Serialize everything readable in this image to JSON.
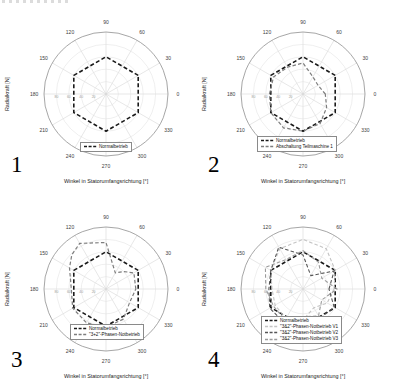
{
  "colors": {
    "black_series": "#1a1a1a",
    "gray_series": "#7d7d7d",
    "light_gray_series": "#c4c4c4",
    "dark_gray_series": "#565656",
    "mid_gray_series": "#9b9b9b",
    "grid_ring": "#dedede",
    "grid_spoke": "#d6d6d6",
    "outer_ring": "#8f8f8f",
    "tick_text": "#3c3c3c",
    "radial_tick_text": "#9a9a9a"
  },
  "panels": [
    {
      "number": "1",
      "xlabel": "Winkel in Statorumfangsrichtung [°]",
      "ylabel": "Radialkraft [N]",
      "angle_labels": [
        "0",
        "30",
        "60",
        "90",
        "120",
        "150",
        "180",
        "210",
        "240",
        "270",
        "300",
        "330"
      ],
      "radial_labels": [
        "20",
        "40",
        "60",
        "80"
      ],
      "legend_pos": {
        "left": 80,
        "top": 142
      },
      "legend": [
        {
          "label": "Normalbetrieb",
          "color": "#1a1a1a"
        }
      ],
      "series": [
        {
          "name": "Normalbetrieb",
          "color": "#1a1a1a",
          "width": 1.6,
          "dash": "4,2.4",
          "points": [
            [
              30,
              0.6
            ],
            [
              90,
              0.6
            ],
            [
              150,
              0.6
            ],
            [
              210,
              0.6
            ],
            [
              270,
              0.6
            ],
            [
              330,
              0.6
            ]
          ]
        }
      ]
    },
    {
      "number": "2",
      "xlabel": "Winkel in Statorumfangsrichtung [°]",
      "ylabel": "Radialkraft [N]",
      "angle_labels": [
        "0",
        "30",
        "60",
        "90",
        "120",
        "150",
        "180",
        "210",
        "240",
        "270",
        "300",
        "330"
      ],
      "radial_labels": [
        "20",
        "40",
        "60",
        "80"
      ],
      "legend_pos": {
        "left": 60,
        "top": 136
      },
      "legend": [
        {
          "label": "Normalbetrieb",
          "color": "#1a1a1a"
        },
        {
          "label": "Abschaltung Teilmaschine 1",
          "color": "#7d7d7d"
        }
      ],
      "series": [
        {
          "name": "Normalbetrieb",
          "color": "#1a1a1a",
          "width": 1.6,
          "dash": "4,2.4",
          "points": [
            [
              30,
              0.6
            ],
            [
              90,
              0.6
            ],
            [
              150,
              0.6
            ],
            [
              210,
              0.6
            ],
            [
              270,
              0.6
            ],
            [
              330,
              0.6
            ]
          ]
        },
        {
          "name": "Abschaltung Teilmaschine 1",
          "color": "#7d7d7d",
          "width": 1.2,
          "dash": "3.5,2.2",
          "points": [
            [
              0,
              0.36
            ],
            [
              30,
              0.28
            ],
            [
              60,
              0.32
            ],
            [
              90,
              0.5
            ],
            [
              120,
              0.5
            ],
            [
              150,
              0.55
            ],
            [
              180,
              0.54
            ],
            [
              210,
              0.6
            ],
            [
              240,
              0.63
            ],
            [
              270,
              0.6
            ],
            [
              300,
              0.55
            ],
            [
              330,
              0.44
            ]
          ]
        }
      ]
    },
    {
      "number": "3",
      "xlabel": "Winkel in Statorumfangsrichtung [°]",
      "ylabel": "Radialkraft [N]",
      "angle_labels": [
        "0",
        "30",
        "60",
        "90",
        "120",
        "150",
        "180",
        "210",
        "240",
        "270",
        "300",
        "330"
      ],
      "radial_labels": [
        "20",
        "40",
        "60",
        "80"
      ],
      "legend_pos": {
        "left": 70,
        "top": 129
      },
      "legend": [
        {
          "label": "Normalbetrieb",
          "color": "#1a1a1a"
        },
        {
          "label": "\"3+2\"-Phasen-Notbetrieb",
          "color": "#7d7d7d"
        }
      ],
      "series": [
        {
          "name": "Normalbetrieb",
          "color": "#1a1a1a",
          "width": 1.6,
          "dash": "4,2.4",
          "points": [
            [
              30,
              0.6
            ],
            [
              90,
              0.6
            ],
            [
              150,
              0.6
            ],
            [
              210,
              0.6
            ],
            [
              270,
              0.6
            ],
            [
              330,
              0.6
            ]
          ]
        },
        {
          "name": "\"3+2\"-Phasen-Notbetrieb",
          "color": "#7d7d7d",
          "width": 1.2,
          "dash": "3.5,2.2",
          "points": [
            [
              0,
              0.48
            ],
            [
              30,
              0.52
            ],
            [
              45,
              0.4
            ],
            [
              60,
              0.3
            ],
            [
              90,
              0.75
            ],
            [
              120,
              0.85
            ],
            [
              135,
              0.78
            ],
            [
              150,
              0.68
            ],
            [
              180,
              0.56
            ],
            [
              210,
              0.62
            ],
            [
              240,
              0.63
            ],
            [
              270,
              0.62
            ],
            [
              300,
              0.56
            ],
            [
              330,
              0.44
            ]
          ]
        }
      ]
    },
    {
      "number": "4",
      "xlabel": "Winkel in Statorumfangsrichtung [°]",
      "ylabel": "Radialkraft [N]",
      "angle_labels": [
        "0",
        "30",
        "60",
        "90",
        "120",
        "150",
        "180",
        "210",
        "240",
        "270",
        "300",
        "330"
      ],
      "radial_labels": [
        "20",
        "40",
        "60",
        "80"
      ],
      "legend_pos": {
        "left": 64,
        "top": 121
      },
      "legend": [
        {
          "label": "Normalbetrieb",
          "color": "#1a1a1a"
        },
        {
          "label": "\"3&2\"-Phasen-Notbetrieb V1",
          "color": "#c4c4c4"
        },
        {
          "label": "\"3&2\"-Phasen-Notbetrieb V2",
          "color": "#565656"
        },
        {
          "label": "\"3&2\"-Phasen-Notbetrieb V3",
          "color": "#9b9b9b"
        }
      ],
      "series": [
        {
          "name": "Normalbetrieb",
          "color": "#1a1a1a",
          "width": 1.6,
          "dash": "4,2.4",
          "points": [
            [
              30,
              0.6
            ],
            [
              90,
              0.6
            ],
            [
              150,
              0.6
            ],
            [
              210,
              0.6
            ],
            [
              270,
              0.6
            ],
            [
              330,
              0.6
            ]
          ]
        },
        {
          "name": "\"3&2\"-Phasen-Notbetrieb V1",
          "color": "#c4c4c4",
          "width": 1.1,
          "dash": "3.5,2.2",
          "points": [
            [
              0,
              0.5
            ],
            [
              30,
              0.6
            ],
            [
              60,
              0.75
            ],
            [
              90,
              0.8
            ],
            [
              120,
              0.75
            ],
            [
              150,
              0.6
            ],
            [
              180,
              0.5
            ],
            [
              210,
              0.52
            ],
            [
              240,
              0.55
            ],
            [
              270,
              0.5
            ],
            [
              300,
              0.35
            ],
            [
              330,
              0.45
            ]
          ]
        },
        {
          "name": "\"3&2\"-Phasen-Notbetrieb V2",
          "color": "#565656",
          "width": 1.1,
          "dash": "3.5,2.2",
          "points": [
            [
              0,
              0.42
            ],
            [
              30,
              0.58
            ],
            [
              60,
              0.25
            ],
            [
              90,
              0.55
            ],
            [
              120,
              0.78
            ],
            [
              150,
              0.6
            ],
            [
              180,
              0.55
            ],
            [
              210,
              0.62
            ],
            [
              240,
              0.62
            ],
            [
              270,
              0.58
            ],
            [
              300,
              0.55
            ],
            [
              330,
              0.58
            ]
          ]
        },
        {
          "name": "\"3&2\"-Phasen-Notbetrieb V3",
          "color": "#9b9b9b",
          "width": 1.1,
          "dash": "3.5,2.2",
          "points": [
            [
              0,
              0.55
            ],
            [
              30,
              0.35
            ],
            [
              60,
              0.5
            ],
            [
              90,
              0.62
            ],
            [
              120,
              0.55
            ],
            [
              150,
              0.7
            ],
            [
              180,
              0.6
            ],
            [
              210,
              0.55
            ],
            [
              240,
              0.58
            ],
            [
              270,
              0.45
            ],
            [
              300,
              0.5
            ],
            [
              330,
              0.35
            ]
          ]
        }
      ]
    }
  ],
  "chart_data": [
    {
      "type": "radar",
      "subplot": "1",
      "angular_axis_label": "Winkel in Statorumfangsrichtung [°]",
      "radial_axis_label": "Radialkraft [N]",
      "angular_ticks_deg": [
        0,
        30,
        60,
        90,
        120,
        150,
        180,
        210,
        240,
        270,
        300,
        330
      ],
      "radial_ticks": [
        20,
        40,
        60,
        80
      ],
      "radial_ticks_note": "radial tick numerals illegible at source resolution; values estimated",
      "grid": true,
      "legend_position": "inside-bottom",
      "series": [
        {
          "name": "Normalbetrieb",
          "points_deg_rfrac": [
            [
              30,
              0.6
            ],
            [
              90,
              0.6
            ],
            [
              150,
              0.6
            ],
            [
              210,
              0.6
            ],
            [
              270,
              0.6
            ],
            [
              330,
              0.6
            ]
          ]
        }
      ]
    },
    {
      "type": "radar",
      "subplot": "2",
      "angular_axis_label": "Winkel in Statorumfangsrichtung [°]",
      "radial_axis_label": "Radialkraft [N]",
      "angular_ticks_deg": [
        0,
        30,
        60,
        90,
        120,
        150,
        180,
        210,
        240,
        270,
        300,
        330
      ],
      "radial_ticks": [
        20,
        40,
        60,
        80
      ],
      "grid": true,
      "legend_position": "inside-bottom",
      "series": [
        {
          "name": "Normalbetrieb",
          "points_deg_rfrac": [
            [
              30,
              0.6
            ],
            [
              90,
              0.6
            ],
            [
              150,
              0.6
            ],
            [
              210,
              0.6
            ],
            [
              270,
              0.6
            ],
            [
              330,
              0.6
            ]
          ]
        },
        {
          "name": "Abschaltung Teilmaschine 1",
          "points_deg_rfrac": [
            [
              0,
              0.36
            ],
            [
              30,
              0.28
            ],
            [
              60,
              0.32
            ],
            [
              90,
              0.5
            ],
            [
              120,
              0.5
            ],
            [
              150,
              0.55
            ],
            [
              180,
              0.54
            ],
            [
              210,
              0.6
            ],
            [
              240,
              0.63
            ],
            [
              270,
              0.6
            ],
            [
              300,
              0.55
            ],
            [
              330,
              0.44
            ]
          ]
        }
      ]
    },
    {
      "type": "radar",
      "subplot": "3",
      "angular_axis_label": "Winkel in Statorumfangsrichtung [°]",
      "radial_axis_label": "Radialkraft [N]",
      "angular_ticks_deg": [
        0,
        30,
        60,
        90,
        120,
        150,
        180,
        210,
        240,
        270,
        300,
        330
      ],
      "radial_ticks": [
        20,
        40,
        60,
        80
      ],
      "grid": true,
      "legend_position": "inside-bottom",
      "series": [
        {
          "name": "Normalbetrieb",
          "points_deg_rfrac": [
            [
              30,
              0.6
            ],
            [
              90,
              0.6
            ],
            [
              150,
              0.6
            ],
            [
              210,
              0.6
            ],
            [
              270,
              0.6
            ],
            [
              330,
              0.6
            ]
          ]
        },
        {
          "name": "\"3+2\"-Phasen-Notbetrieb",
          "points_deg_rfrac": [
            [
              0,
              0.48
            ],
            [
              30,
              0.52
            ],
            [
              45,
              0.4
            ],
            [
              60,
              0.3
            ],
            [
              90,
              0.75
            ],
            [
              120,
              0.85
            ],
            [
              135,
              0.78
            ],
            [
              150,
              0.68
            ],
            [
              180,
              0.56
            ],
            [
              210,
              0.62
            ],
            [
              240,
              0.63
            ],
            [
              270,
              0.62
            ],
            [
              300,
              0.56
            ],
            [
              330,
              0.44
            ]
          ]
        }
      ]
    },
    {
      "type": "radar",
      "subplot": "4",
      "angular_axis_label": "Winkel in Statorumfangsrichtung [°]",
      "radial_axis_label": "Radialkraft [N]",
      "angular_ticks_deg": [
        0,
        30,
        60,
        90,
        120,
        150,
        180,
        210,
        240,
        270,
        300,
        330
      ],
      "radial_ticks": [
        20,
        40,
        60,
        80
      ],
      "grid": true,
      "legend_position": "inside-bottom",
      "series": [
        {
          "name": "Normalbetrieb",
          "points_deg_rfrac": [
            [
              30,
              0.6
            ],
            [
              90,
              0.6
            ],
            [
              150,
              0.6
            ],
            [
              210,
              0.6
            ],
            [
              270,
              0.6
            ],
            [
              330,
              0.6
            ]
          ]
        },
        {
          "name": "\"3&2\"-Phasen-Notbetrieb V1",
          "points_deg_rfrac": [
            [
              0,
              0.5
            ],
            [
              30,
              0.6
            ],
            [
              60,
              0.75
            ],
            [
              90,
              0.8
            ],
            [
              120,
              0.75
            ],
            [
              150,
              0.6
            ],
            [
              180,
              0.5
            ],
            [
              210,
              0.52
            ],
            [
              240,
              0.55
            ],
            [
              270,
              0.5
            ],
            [
              300,
              0.35
            ],
            [
              330,
              0.45
            ]
          ]
        },
        {
          "name": "\"3&2\"-Phasen-Notbetrieb V2",
          "points_deg_rfrac": [
            [
              0,
              0.42
            ],
            [
              30,
              0.58
            ],
            [
              60,
              0.25
            ],
            [
              90,
              0.55
            ],
            [
              120,
              0.78
            ],
            [
              150,
              0.6
            ],
            [
              180,
              0.55
            ],
            [
              210,
              0.62
            ],
            [
              240,
              0.62
            ],
            [
              270,
              0.58
            ],
            [
              300,
              0.55
            ],
            [
              330,
              0.58
            ]
          ]
        },
        {
          "name": "\"3&2\"-Phasen-Notbetrieb V3",
          "points_deg_rfrac": [
            [
              0,
              0.55
            ],
            [
              30,
              0.35
            ],
            [
              60,
              0.5
            ],
            [
              90,
              0.62
            ],
            [
              120,
              0.55
            ],
            [
              150,
              0.7
            ],
            [
              180,
              0.6
            ],
            [
              210,
              0.55
            ],
            [
              240,
              0.58
            ],
            [
              270,
              0.45
            ],
            [
              300,
              0.5
            ],
            [
              330,
              0.35
            ]
          ]
        }
      ]
    }
  ]
}
